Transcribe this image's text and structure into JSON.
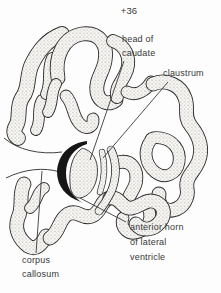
{
  "figure": {
    "slice_level": "+36"
  },
  "labels": {
    "head_of_caudate": {
      "line1": "head of",
      "line2": "caudate"
    },
    "claustrum": {
      "text": "claustrum"
    },
    "anterior_horn_of_lateral_ventricle": {
      "line1": "anterior horn",
      "line2": "of lateral",
      "line3": "ventricle"
    },
    "corpus_callosum": {
      "line1": "corpus",
      "line2": "callosum"
    }
  },
  "colors": {
    "ink_outline": "#2c2c2c",
    "label_text": "#383838",
    "ventricle_fill": "#161616",
    "stipple_dot": "#6f6f6f",
    "background": "#fdfdfd"
  }
}
